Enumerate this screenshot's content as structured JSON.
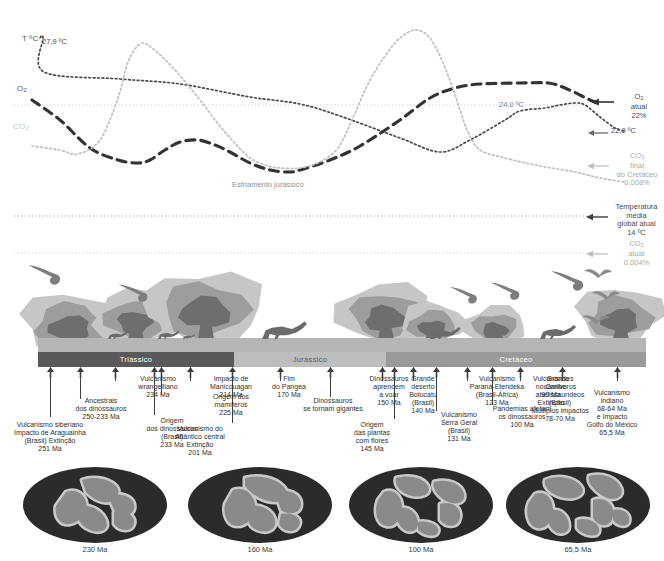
{
  "chart_data": {
    "type": "line",
    "title": "",
    "xlabel": "",
    "ylabel": "",
    "axis_labels": {
      "temperature": "T ºC",
      "oxygen": "O",
      "oxygen_sub": "2",
      "co2": "CO",
      "co2_sub": "2"
    },
    "value_labels": [
      {
        "name": "start-temperature",
        "text": "27,9 ºC"
      },
      {
        "name": "late-temperature",
        "text": "24,0 ºC"
      }
    ],
    "annotations": [
      {
        "name": "jurassic-cooling",
        "text": "Esfriamento jurássico"
      }
    ],
    "right_callouts": [
      {
        "name": "o2-present-day",
        "lines": [
          "O",
          "atual",
          "22%"
        ],
        "sub": "2",
        "tone": "dark"
      },
      {
        "name": "temp-22",
        "lines": [
          "22,0 ºC"
        ],
        "tone": "dark"
      },
      {
        "name": "co2-end-cretaceous",
        "lines": [
          "CO",
          "final",
          "do Cretáceo",
          "0,008%"
        ],
        "sub": "2",
        "tone": "light"
      },
      {
        "name": "global-mean-temp-today",
        "lines": [
          "Temperatura",
          "média",
          "global atual",
          "14 ºC"
        ],
        "tone": "dark"
      },
      {
        "name": "co2-present-day",
        "lines": [
          "CO",
          "atual",
          "0,004%"
        ],
        "sub": "2",
        "tone": "light"
      }
    ],
    "series": [
      {
        "name": "Temperatura",
        "style": "fine-dotted",
        "color": "#4a4a4a",
        "points": [
          [
            40,
            38
          ],
          [
            43,
            38
          ],
          [
            44,
            72
          ],
          [
            120,
            79
          ],
          [
            180,
            84
          ],
          [
            250,
            97
          ],
          [
            300,
            104
          ],
          [
            340,
            116
          ],
          [
            400,
            138
          ],
          [
            440,
            152
          ],
          [
            470,
            140
          ],
          [
            505,
            120
          ],
          [
            520,
            111
          ],
          [
            545,
            108
          ],
          [
            560,
            105
          ],
          [
            575,
            103
          ],
          [
            585,
            105
          ],
          [
            600,
            117
          ],
          [
            615,
            128
          ],
          [
            624,
            131
          ]
        ]
      },
      {
        "name": "O2",
        "style": "long-dashed",
        "color": "#333333",
        "points": [
          [
            32,
            100
          ],
          [
            60,
            120
          ],
          [
            90,
            148
          ],
          [
            118,
            160
          ],
          [
            138,
            163
          ],
          [
            150,
            160
          ],
          [
            165,
            150
          ],
          [
            180,
            142
          ],
          [
            198,
            140
          ],
          [
            215,
            145
          ],
          [
            230,
            152
          ],
          [
            250,
            163
          ],
          [
            270,
            170
          ],
          [
            288,
            172
          ],
          [
            300,
            170
          ],
          [
            330,
            160
          ],
          [
            360,
            146
          ],
          [
            400,
            120
          ],
          [
            430,
            98
          ],
          [
            455,
            88
          ],
          [
            480,
            84
          ],
          [
            520,
            83
          ],
          [
            548,
            83
          ],
          [
            565,
            88
          ],
          [
            590,
            100
          ],
          [
            600,
            104
          ]
        ]
      },
      {
        "name": "CO2",
        "style": "fine-dotted",
        "color": "#bfbfbf",
        "points": [
          [
            32,
            146
          ],
          [
            60,
            150
          ],
          [
            78,
            154
          ],
          [
            100,
            140
          ],
          [
            118,
            98
          ],
          [
            128,
            62
          ],
          [
            140,
            44
          ],
          [
            152,
            48
          ],
          [
            175,
            70
          ],
          [
            200,
            100
          ],
          [
            215,
            120
          ],
          [
            232,
            140
          ],
          [
            250,
            158
          ],
          [
            268,
            166
          ],
          [
            280,
            168
          ],
          [
            300,
            168
          ],
          [
            320,
            162
          ],
          [
            338,
            148
          ],
          [
            352,
            120
          ],
          [
            368,
            84
          ],
          [
            385,
            56
          ],
          [
            400,
            38
          ],
          [
            415,
            30
          ],
          [
            428,
            36
          ],
          [
            440,
            56
          ],
          [
            452,
            86
          ],
          [
            460,
            110
          ],
          [
            468,
            132
          ],
          [
            480,
            150
          ],
          [
            505,
            158
          ],
          [
            540,
            166
          ],
          [
            575,
            172
          ],
          [
            600,
            178
          ],
          [
            624,
            182
          ]
        ]
      }
    ],
    "reference_lines": [
      {
        "name": "o2-reference-line",
        "y": 105,
        "color": "#c9c9c9"
      },
      {
        "name": "temperature-reference-line",
        "y": 216,
        "color": "#9e9e9e"
      },
      {
        "name": "co2-reference-line",
        "y": 253,
        "color": "#cfcfcf"
      }
    ]
  },
  "periods": [
    {
      "name": "triassico",
      "label": "Triássico",
      "left": 0,
      "width": 196,
      "fill": "#595959",
      "tone": "dark"
    },
    {
      "name": "jurassico",
      "label": "Jurássico",
      "left": 196,
      "width": 152,
      "fill": "#bdbdbd",
      "tone": "light"
    },
    {
      "name": "cretaceo",
      "label": "Cretáceo",
      "left": 348,
      "width": 260,
      "fill": "#9a9a9a",
      "tone": "dark"
    }
  ],
  "events": [
    {
      "name": "vulcanismo-siberiano",
      "x": 50,
      "stem": 50,
      "tx": 50,
      "ty": 54,
      "lines": [
        "Vulcanismo siberiano",
        "Impacto de Araguainha",
        "(Brasil) Extinção",
        "251 Ma"
      ]
    },
    {
      "name": "ancestrais-dinossauros",
      "x": 80,
      "stem": 32,
      "tx": 101,
      "ty": 30,
      "lines": [
        "Ancestrais",
        "dos dinossauros",
        "250-233 Ma"
      ]
    },
    {
      "name": "vulcanismo-wrangelliano",
      "x": 115,
      "stem": 14,
      "tx": 158,
      "ty": 8,
      "lines": [
        "Vulcanismo",
        "wrangelliano",
        "234 Ma"
      ]
    },
    {
      "name": "origem-dinossauros-brasil",
      "x": 154,
      "stem": 48,
      "tx": 172,
      "ty": 50,
      "lines": [
        "Origem",
        "dos dinossauros",
        "(Brasil)",
        "233 Ma"
      ]
    },
    {
      "name": "origem-mamiferos",
      "x": 161,
      "stem": 28,
      "tx": 231,
      "ty": 26,
      "lines": [
        "Origem dos",
        "mamíferos",
        "225 Ma"
      ]
    },
    {
      "name": "impacto-manicouagan",
      "x": 190,
      "stem": 14,
      "tx": 231,
      "ty": 8,
      "lines": [
        "Impacto de",
        "Manicouagan",
        "214 Ma"
      ]
    },
    {
      "name": "vulcanismo-atlantico-central",
      "x": 232,
      "stem": 56,
      "tx": 200,
      "ty": 58,
      "lines": [
        "Vulcanismo do",
        "Atlântico central",
        "Extinção",
        "201 Ma"
      ]
    },
    {
      "name": "fim-do-pangea",
      "x": 280,
      "stem": 14,
      "tx": 289,
      "ty": 8,
      "lines": [
        "Fim",
        "do Pangea",
        "170 Ma"
      ]
    },
    {
      "name": "dinossauros-gigantes",
      "x": 330,
      "stem": 30,
      "tx": 333,
      "ty": 30,
      "lines": [
        "Dinossauros",
        "se tornam gigantes"
      ]
    },
    {
      "name": "dinossauros-aprendem-voar",
      "x": 382,
      "stem": 14,
      "tx": 389,
      "ty": 8,
      "lines": [
        "Dinossauros",
        "aprendem",
        "a voar",
        "150 Ma"
      ]
    },
    {
      "name": "origem-plantas-com-flores",
      "x": 394,
      "stem": 52,
      "tx": 372,
      "ty": 54,
      "lines": [
        "Origem",
        "das plantas",
        "com flores",
        "145 Ma"
      ]
    },
    {
      "name": "grande-deserto-botucatu",
      "x": 413,
      "stem": 14,
      "tx": 423,
      "ty": 8,
      "lines": [
        "Grande",
        "deserto",
        "Botucatu",
        "(Brasil)",
        "140 Ma"
      ]
    },
    {
      "name": "vulcanismo-serra-geral",
      "x": 436,
      "stem": 44,
      "tx": 459,
      "ty": 44,
      "lines": [
        "Vulcanismo",
        "Serra Geral",
        "(Brasil)",
        "131 Ma"
      ]
    },
    {
      "name": "vulcanismo-parana-etendeka",
      "x": 467,
      "stem": 14,
      "tx": 497,
      "ty": 8,
      "lines": [
        "Vulcanismo",
        "Paraná-Etendeka",
        "(Brasil-África)",
        "123 Ma"
      ]
    },
    {
      "name": "pandemias-dinossauros",
      "x": 492,
      "stem": 38,
      "tx": 522,
      "ty": 38,
      "lines": [
        "Pandemias afetam",
        "os dinossauros",
        "100 Ma"
      ]
    },
    {
      "name": "vulcanismo-caribe",
      "x": 520,
      "stem": 14,
      "tx": 551,
      "ty": 8,
      "lines": [
        "Vulcanismo",
        "no Caribe",
        "90 Ma",
        "Extinção"
      ]
    },
    {
      "name": "grandes-carnivoros-abelissaurideos",
      "x": 562,
      "stem": 14,
      "tx": 560,
      "ty": 8,
      "lines": [
        "Grandes",
        "carnívoros",
        "abelissaurídeos",
        "(Brasil)",
        "Múltiplos impactos",
        "78-70 Ma"
      ]
    },
    {
      "name": "vulcanismo-indiano",
      "x": 617,
      "stem": 14,
      "tx": 612,
      "ty": 22,
      "lines": [
        "Vulcanismo",
        "indiano",
        "68-64 Ma",
        "e Impacto",
        "Golfo do México",
        "65,5 Ma"
      ]
    }
  ],
  "maps": [
    {
      "name": "map-230ma",
      "caption": "230 Ma",
      "left": 22
    },
    {
      "name": "map-160ma",
      "caption": "160 Ma",
      "left": 187
    },
    {
      "name": "map-100ma",
      "caption": "100 Ma",
      "left": 348
    },
    {
      "name": "map-655ma",
      "caption": "65,5 Ma",
      "left": 505
    }
  ],
  "colors": {
    "ocean": "#2b2b2b",
    "land": "#8a8a8a",
    "shelf": "#c9c9c9",
    "plume_light": "#c6c6c6",
    "plume_mid": "#9d9d9d",
    "plume_dark": "#6e6e6e",
    "ground": "#b5b5b5"
  }
}
